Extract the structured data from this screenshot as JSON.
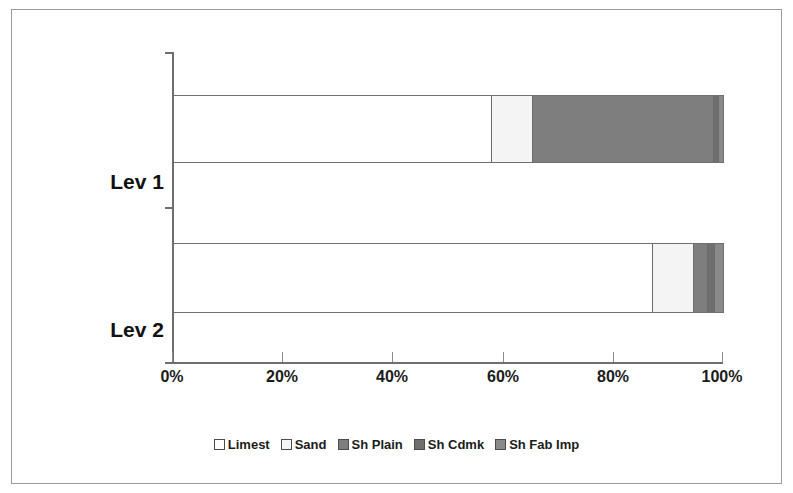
{
  "chart_data": {
    "type": "bar",
    "orientation": "horizontal",
    "stacked": true,
    "normalized": true,
    "title": "",
    "subtitle": "",
    "xlabel": "",
    "ylabel": "",
    "categories": [
      "Lev 1",
      "Lev 2"
    ],
    "xlim": [
      0,
      100
    ],
    "xticks": [
      0,
      20,
      40,
      60,
      80,
      100
    ],
    "xtick_labels": [
      "0%",
      "20%",
      "40%",
      "60%",
      "80%",
      "100%"
    ],
    "grid": false,
    "legend_position": "bottom",
    "series": [
      {
        "name": "Limest",
        "color": "#ffffff",
        "values": [
          58.0,
          87.3
        ]
      },
      {
        "name": "Sand",
        "color": "#f4f4f4",
        "values": [
          7.4,
          7.4
        ]
      },
      {
        "name": "Sh Plain",
        "color": "#7e7e7e",
        "values": [
          32.9,
          2.6
        ]
      },
      {
        "name": "Sh Cdmk",
        "color": "#6f6f6f",
        "values": [
          0.9,
          1.3
        ]
      },
      {
        "name": "Sh Fab Imp",
        "color": "#8a8a8a",
        "values": [
          0.8,
          1.4
        ]
      }
    ]
  },
  "axis": {
    "tick_labels": [
      "0%",
      "20%",
      "40%",
      "60%",
      "80%",
      "100%"
    ],
    "category_labels": [
      "Lev 1",
      "Lev 2"
    ]
  },
  "legend": {
    "items": [
      {
        "label": "Limest"
      },
      {
        "label": "Sand"
      },
      {
        "label": "Sh Plain"
      },
      {
        "label": "Sh Cdmk"
      },
      {
        "label": "Sh Fab Imp"
      }
    ]
  },
  "colors": {
    "axis": "#6e6e6e",
    "bar_outline": "#707070",
    "text": "#1b1b1b",
    "frame": "#9a9a9a"
  }
}
